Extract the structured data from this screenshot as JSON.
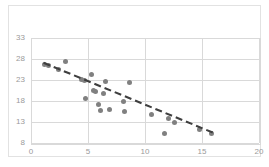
{
  "chart_data": {
    "type": "scatter",
    "title": "",
    "subtitle": "",
    "xlabel": "",
    "ylabel": "",
    "xlim": [
      0,
      20
    ],
    "ylim": [
      8,
      33
    ],
    "xticks": [
      0,
      5,
      10,
      15,
      20
    ],
    "yticks": [
      8,
      13,
      18,
      23,
      28,
      33
    ],
    "xtick_labels": [
      "0",
      "5",
      "10",
      "15",
      "20"
    ],
    "ytick_labels": [
      "8",
      "13",
      "18",
      "23",
      "28",
      "33"
    ],
    "grid": true,
    "legend": false,
    "legend_position": "none",
    "marker_color": "#808080",
    "marker_shape": "circle",
    "gridline_color": "#d9d9d9",
    "tick_label_color": "#9a9a9a",
    "frame_color": "#e2e2e2",
    "background_color": "#ffffff",
    "series": [
      {
        "name": "observations",
        "points": [
          [
            1.2,
            26.8
          ],
          [
            1.5,
            26.4
          ],
          [
            2.4,
            25.5
          ],
          [
            3.0,
            27.4
          ],
          [
            4.4,
            23.1
          ],
          [
            4.7,
            22.8
          ],
          [
            4.8,
            18.5
          ],
          [
            5.3,
            24.3
          ],
          [
            5.5,
            20.6
          ],
          [
            5.7,
            20.2
          ],
          [
            5.9,
            17.2
          ],
          [
            6.1,
            15.8
          ],
          [
            6.4,
            19.7
          ],
          [
            6.5,
            22.6
          ],
          [
            6.9,
            15.9
          ],
          [
            8.1,
            18.0
          ],
          [
            8.2,
            15.4
          ],
          [
            8.6,
            22.4
          ],
          [
            10.6,
            14.8
          ],
          [
            11.7,
            10.3
          ],
          [
            12.1,
            13.8
          ],
          [
            12.6,
            12.9
          ],
          [
            14.8,
            11.2
          ],
          [
            15.8,
            10.2
          ]
        ]
      }
    ],
    "trendline": {
      "name": "linear-trend",
      "style": "dashed",
      "color": "#3f3f3f",
      "x_start": 1.1,
      "y_start": 27.1,
      "x_end": 16.2,
      "y_end": 10.2
    }
  }
}
